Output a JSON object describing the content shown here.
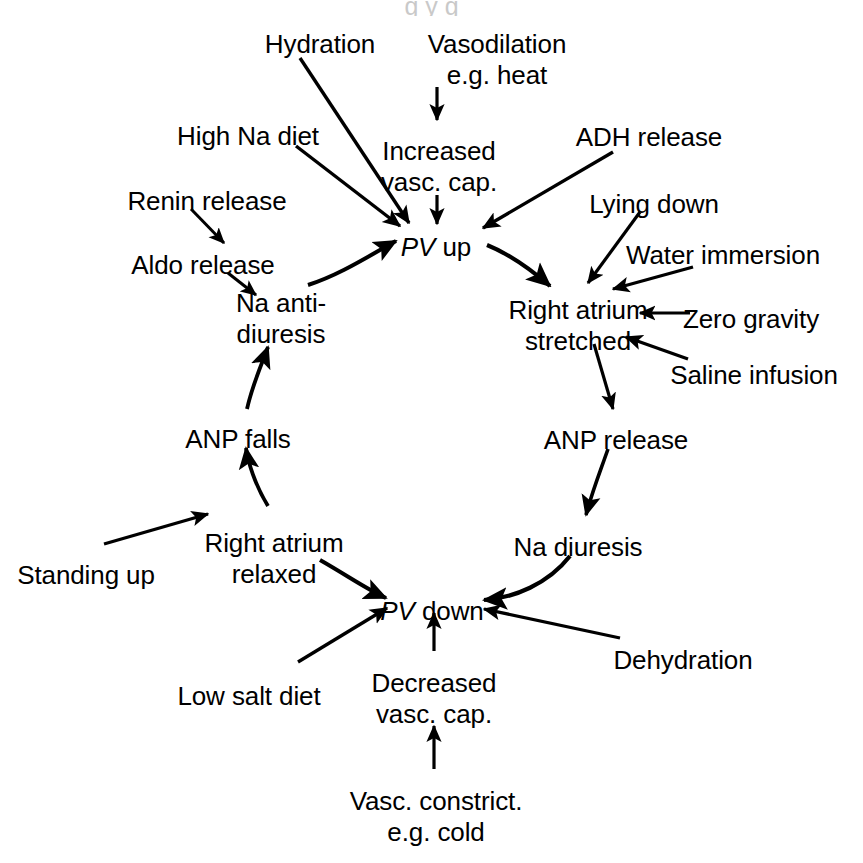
{
  "figure": {
    "background_color": "#ffffff",
    "ink_color": "#000000",
    "top_cropped_caption_remnant": "g y g"
  },
  "nodes": {
    "hydration": {
      "label": "Hydration",
      "x": 320,
      "y": 29,
      "align": "c"
    },
    "vasodilation": {
      "label": "Vasodilation\ne.g. heat",
      "x": 497,
      "y": 29,
      "align": "c"
    },
    "high_na_diet": {
      "label": "High Na diet",
      "x": 248,
      "y": 121,
      "align": "c"
    },
    "increased_vasc_cap": {
      "label": "Increased\nvasc. cap.",
      "x": 439,
      "y": 136,
      "align": "c"
    },
    "adh_release": {
      "label": "ADH release",
      "x": 649,
      "y": 122,
      "align": "c"
    },
    "renin_release": {
      "label": "Renin release",
      "x": 207,
      "y": 186,
      "align": "c"
    },
    "lying_down": {
      "label": "Lying down",
      "x": 654,
      "y": 189,
      "align": "c"
    },
    "aldo_release": {
      "label": "Aldo release",
      "x": 203,
      "y": 250,
      "align": "c"
    },
    "pv_up": {
      "label_italic": "PV",
      "label_rest": " up",
      "x": 436,
      "y": 232,
      "align": "c"
    },
    "water_immersion": {
      "label": "Water immersion",
      "x": 723,
      "y": 240,
      "align": "c"
    },
    "na_antidiuresis": {
      "label": "Na anti-\ndiuresis",
      "x": 281,
      "y": 288,
      "align": "c"
    },
    "right_atrium_stretched": {
      "label": "Right atrium\nstretched",
      "x": 578,
      "y": 295,
      "align": "c"
    },
    "zero_gravity": {
      "label": "Zero gravity",
      "x": 751,
      "y": 304,
      "align": "c"
    },
    "saline_infusion": {
      "label": "Saline infusion",
      "x": 754,
      "y": 360,
      "align": "c"
    },
    "anp_falls": {
      "label": "ANP falls",
      "x": 238,
      "y": 424,
      "align": "c"
    },
    "anp_release": {
      "label": "ANP release",
      "x": 616,
      "y": 425,
      "align": "c"
    },
    "right_atrium_relaxed": {
      "label": "Right atrium\nrelaxed",
      "x": 274,
      "y": 528,
      "align": "c"
    },
    "na_diuresis": {
      "label": "Na diuresis",
      "x": 578,
      "y": 532,
      "align": "c"
    },
    "standing_up": {
      "label": "Standing up",
      "x": 86,
      "y": 560,
      "align": "c"
    },
    "pv_down": {
      "label_italic": "PV",
      "label_rest": " down",
      "x": 432,
      "y": 596,
      "align": "c"
    },
    "dehydration": {
      "label": "Dehydration",
      "x": 683,
      "y": 645,
      "align": "c"
    },
    "low_salt_diet": {
      "label": "Low salt diet",
      "x": 249,
      "y": 681,
      "align": "c"
    },
    "decreased_vasc_cap": {
      "label": "Decreased\nvasc. cap.",
      "x": 434,
      "y": 668,
      "align": "c"
    },
    "vasc_constrict": {
      "label": "Vasc. constrict.\ne.g. cold",
      "x": 436,
      "y": 786,
      "align": "c"
    }
  },
  "edges": [
    {
      "id": "hydration-to-pv-up",
      "from": "Hydration",
      "to": "PV up",
      "style": "straight"
    },
    {
      "id": "high-na-diet-to-pv-up",
      "from": "High Na diet",
      "to": "PV up",
      "style": "straight"
    },
    {
      "id": "vasodilation-to-increased-vasc",
      "from": "Vasodilation e.g. heat",
      "to": "Increased vasc. cap.",
      "style": "straight"
    },
    {
      "id": "increased-vasc-to-pv-up",
      "from": "Increased vasc. cap.",
      "to": "PV up",
      "style": "straight"
    },
    {
      "id": "adh-release-to-pv-up",
      "from": "ADH release",
      "to": "PV up",
      "style": "straight"
    },
    {
      "id": "renin-to-aldo",
      "from": "Renin release",
      "to": "Aldo release",
      "style": "straight"
    },
    {
      "id": "aldo-to-na-antidiuresis",
      "from": "Aldo release",
      "to": "Na anti-diuresis",
      "style": "straight"
    },
    {
      "id": "na-antidiuresis-to-pv-up",
      "from": "Na anti-diuresis",
      "to": "PV up",
      "style": "curved"
    },
    {
      "id": "pv-up-to-right-atrium-stretched",
      "from": "PV up",
      "to": "Right atrium stretched",
      "style": "curved"
    },
    {
      "id": "lying-down-to-right-atrium",
      "from": "Lying down",
      "to": "Right atrium stretched",
      "style": "straight"
    },
    {
      "id": "water-immersion-to-right-atrium",
      "from": "Water immersion",
      "to": "Right atrium stretched",
      "style": "straight"
    },
    {
      "id": "zero-gravity-to-right-atrium",
      "from": "Zero gravity",
      "to": "Right atrium stretched",
      "style": "straight"
    },
    {
      "id": "saline-infusion-to-right-atrium",
      "from": "Saline infusion",
      "to": "Right atrium stretched",
      "style": "straight"
    },
    {
      "id": "right-atrium-to-anp-release",
      "from": "Right atrium stretched",
      "to": "ANP release",
      "style": "straight"
    },
    {
      "id": "anp-release-to-na-diuresis",
      "from": "ANP release",
      "to": "Na diuresis",
      "style": "curved"
    },
    {
      "id": "na-diuresis-to-pv-down",
      "from": "Na diuresis",
      "to": "PV down",
      "style": "curved"
    },
    {
      "id": "dehydration-to-pv-down",
      "from": "Dehydration",
      "to": "PV down",
      "style": "straight"
    },
    {
      "id": "decreased-vasc-to-pv-down",
      "from": "Decreased vasc. cap.",
      "to": "PV down",
      "style": "straight"
    },
    {
      "id": "vasc-constrict-to-decreased-vasc",
      "from": "Vasc. constrict. e.g. cold",
      "to": "Decreased vasc. cap.",
      "style": "straight"
    },
    {
      "id": "low-salt-diet-to-pv-down",
      "from": "Low salt diet",
      "to": "PV down",
      "style": "straight"
    },
    {
      "id": "right-atrium-relaxed-to-pv-down",
      "from": "Right atrium relaxed",
      "to": "PV down",
      "style": "curved"
    },
    {
      "id": "standing-up-to-right-atrium-relaxed",
      "from": "Standing up",
      "to": "Right atrium relaxed",
      "style": "straight"
    },
    {
      "id": "right-atrium-relaxed-to-anp-falls",
      "from": "Right atrium relaxed",
      "to": "ANP falls",
      "style": "curved"
    },
    {
      "id": "anp-falls-to-na-antidiuresis",
      "from": "ANP falls",
      "to": "Na anti-diuresis",
      "style": "curved"
    }
  ]
}
